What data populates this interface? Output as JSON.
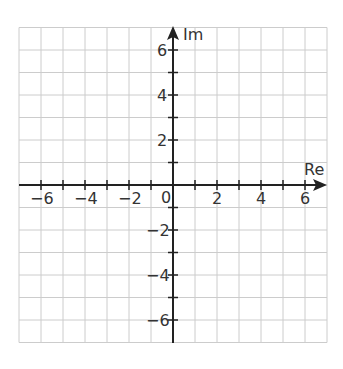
{
  "chart_data": {
    "type": "line",
    "title": "",
    "xlabel": "Re",
    "ylabel": "Im",
    "xlim": [
      -7,
      7
    ],
    "ylim": [
      -7,
      7
    ],
    "grid": true,
    "x_ticks": [
      -7,
      -6,
      -5,
      -4,
      -3,
      -2,
      -1,
      0,
      1,
      2,
      3,
      4,
      5,
      6,
      7
    ],
    "y_ticks": [
      -6,
      -5,
      -4,
      -3,
      -2,
      -1,
      1,
      2,
      3,
      4,
      5,
      6
    ],
    "x_tick_labels": [
      "-6",
      "-4",
      "-2",
      "0",
      "2",
      "4",
      "6"
    ],
    "x_tick_label_values": [
      -6,
      -4,
      -2,
      0,
      2,
      4,
      6
    ],
    "y_tick_labels": [
      "6",
      "4",
      "2",
      "-2",
      "-4",
      "-6"
    ],
    "y_tick_label_values": [
      6,
      4,
      2,
      -2,
      -4,
      -6
    ],
    "series": []
  },
  "colors": {
    "grid": "#cccccc",
    "axis": "#222222",
    "text": "#333333",
    "background": "#ffffff"
  },
  "labels": {
    "re": "Re",
    "im": "Im",
    "origin": "0",
    "x_neg6": "−6",
    "x_neg4": "−4",
    "x_neg2": "−2",
    "x_2": "2",
    "x_4": "4",
    "x_6": "6",
    "y_6": "6",
    "y_4": "4",
    "y_2": "2",
    "y_neg2": "−2",
    "y_neg4": "−4",
    "y_neg6": "−6"
  }
}
